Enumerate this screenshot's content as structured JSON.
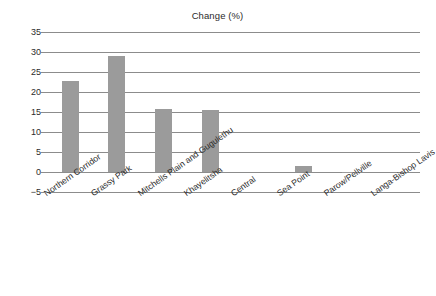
{
  "chart_data": {
    "type": "bar",
    "title": "Change (%)",
    "xlabel": "",
    "ylabel": "",
    "categories": [
      "Northern Corridor",
      "Grassy Park",
      "Mitchells Plain and Gugulethu",
      "Khayelitsha",
      "Central",
      "Sea Point",
      "Parow/Pellville",
      "Langa-Bishop Lavis"
    ],
    "values": [
      22.7,
      29.0,
      15.8,
      15.6,
      0.0,
      1.6,
      -0.2,
      0.1
    ],
    "ylim": [
      -5,
      35
    ],
    "yticks": [
      -5,
      0,
      5,
      10,
      15,
      20,
      25,
      30,
      35
    ],
    "ytick_labels": [
      "−5",
      "0",
      "5",
      "10",
      "15",
      "20",
      "25",
      "30",
      "35"
    ],
    "grid": true,
    "legend": "none",
    "bar_color": "#9b9b9b",
    "grid_color": "#8c8c8c",
    "text_color": "#2b2b2b",
    "background": "#ffffff"
  }
}
